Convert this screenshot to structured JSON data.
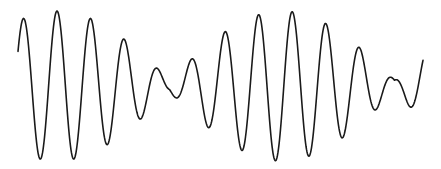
{
  "chart_data": {
    "type": "line",
    "title": "",
    "xlabel": "",
    "ylabel": "",
    "grid": false,
    "legend": null,
    "axes_visible": false,
    "line_color": "#1a1a1a",
    "line_width": 1.6,
    "background": "#ffffff",
    "x_range_px": [
      18,
      423
    ],
    "center_y_px": 86,
    "amplitude_px": 75,
    "carrier_period_px": 33.6,
    "beat_period_px": 225,
    "carrier_phase_peak_x_px": 57,
    "envelope_peak_x_px": 57,
    "envelope_min_ratio": 0.08,
    "extrema_px": {
      "peaks": [
        [
          24,
          20
        ],
        [
          57,
          11
        ],
        [
          91,
          24
        ],
        [
          124,
          58
        ],
        [
          150,
          87
        ],
        [
          176,
          50
        ],
        [
          210,
          20
        ],
        [
          243,
          11
        ],
        [
          277,
          24
        ],
        [
          311,
          58
        ],
        [
          336,
          87
        ],
        [
          363,
          50
        ],
        [
          397,
          20
        ]
      ],
      "troughs": [
        [
          42,
          161
        ],
        [
          75,
          158
        ],
        [
          108,
          133
        ],
        [
          141,
          95
        ],
        [
          159,
          100
        ],
        [
          193,
          137
        ],
        [
          226,
          160
        ],
        [
          260,
          158
        ],
        [
          294,
          133
        ],
        [
          326,
          96
        ],
        [
          345,
          100
        ],
        [
          380,
          137
        ],
        [
          413,
          161
        ]
      ]
    },
    "series": [
      {
        "name": "waveform",
        "start": [
          18,
          70
        ],
        "end": [
          423,
          90
        ]
      }
    ]
  }
}
